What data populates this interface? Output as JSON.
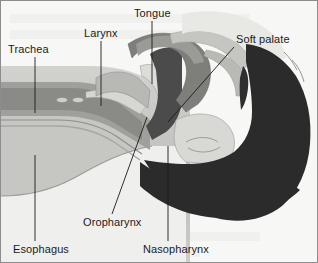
{
  "figure": {
    "background_color": "#f7f7f5",
    "frame_color": "#8d8d8d",
    "label_color": "#1b1b1b",
    "width": 318,
    "height": 263
  },
  "palette": {
    "background": "#f2f2f0",
    "soft_tissue_light": "#d9d9d6",
    "soft_tissue_mid": "#b4b4b1",
    "soft_tissue_dark": "#8f8f8d",
    "muscle": "#a5a5a2",
    "airway_dark": "#4a4a4a",
    "cartilage": "#c9c9c6",
    "bone_light": "#e3e3e0",
    "silhouette": "#2b2b2b",
    "outline": "#6b6b69"
  },
  "labels": [
    {
      "id": "trachea",
      "text": "Trachea",
      "text_x": 8,
      "text_y": 53,
      "leader": "M 35 57 L 35 113"
    },
    {
      "id": "larynx",
      "text": "Larynx",
      "text_x": 84,
      "text_y": 37,
      "leader": "M 101 41 L 101 106"
    },
    {
      "id": "tongue",
      "text": "Tongue",
      "text_x": 134,
      "text_y": 17,
      "leader": "M 152 21 L 152 84"
    },
    {
      "id": "soft-palate",
      "text": "Soft palate",
      "text_x": 236,
      "text_y": 43,
      "leader": "M 234 47 L 168 122"
    },
    {
      "id": "oropharynx",
      "text": "Oropharynx",
      "text_x": 83,
      "text_y": 226,
      "leader": "M 112 214 L 147 117"
    },
    {
      "id": "nasopharynx",
      "text": "Nasopharynx",
      "text_x": 143,
      "text_y": 253,
      "leader": "M 168 241 L 168 146"
    },
    {
      "id": "esophagus",
      "text": "Esophagus",
      "text_x": 13,
      "text_y": 253,
      "leader": "M 35 241 L 35 155"
    }
  ],
  "structures": [
    {
      "id": "neck-soft-tissue",
      "name": "neck-soft-tissue"
    },
    {
      "id": "trachea-lumen",
      "name": "trachea-lumen"
    },
    {
      "id": "tracheal-rings",
      "name": "tracheal-rings"
    },
    {
      "id": "larynx-body",
      "name": "larynx-body"
    },
    {
      "id": "epiglottis",
      "name": "epiglottis"
    },
    {
      "id": "tongue-body",
      "name": "tongue-body"
    },
    {
      "id": "oral-cavity",
      "name": "oral-cavity"
    },
    {
      "id": "soft-palate-body",
      "name": "soft-palate-body"
    },
    {
      "id": "uvula",
      "name": "uvula"
    },
    {
      "id": "pharyngeal-airway",
      "name": "pharyngeal-airway"
    },
    {
      "id": "esophagus-tube",
      "name": "esophagus-tube"
    },
    {
      "id": "head-silhouette",
      "name": "head-silhouette"
    },
    {
      "id": "chin-profile",
      "name": "chin-profile"
    },
    {
      "id": "lips",
      "name": "lips"
    }
  ]
}
